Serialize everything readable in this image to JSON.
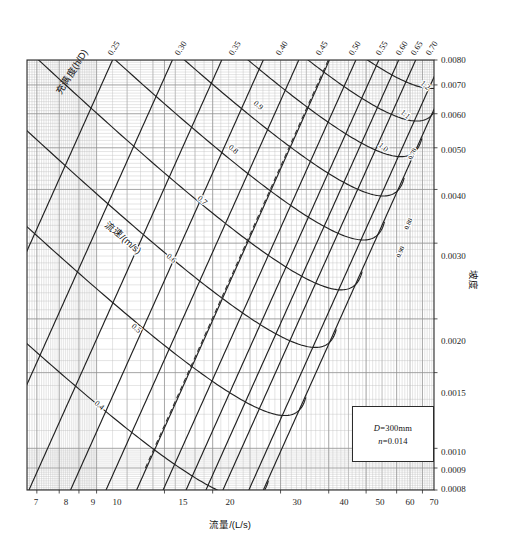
{
  "chart_data": {
    "type": "line",
    "title": "",
    "subtitle": "",
    "xlabel": "流量/(L/s)",
    "ylabel": "坡度",
    "toplabel": "充满度(h/D)",
    "inner_label": "流速/(m/s)",
    "xscale": "log",
    "yscale": "log",
    "xlim": [
      6.6,
      75
    ],
    "ylim": [
      0.0008,
      0.008
    ],
    "grid": true,
    "legend_position": "inner-bottom-right",
    "x_ticks": [
      7,
      8,
      9,
      10,
      15,
      20,
      30,
      40,
      50,
      60,
      70
    ],
    "x_tick_labels": [
      "7",
      "8",
      "9",
      "10",
      "15",
      "20",
      "30",
      "40",
      "50",
      "60",
      "70"
    ],
    "y_ticks": [
      0.0008,
      0.0009,
      0.001,
      0.0015,
      0.002,
      0.003,
      0.004,
      0.005,
      0.006,
      0.007,
      0.008
    ],
    "y_tick_labels": [
      "0.0008",
      "0.0009",
      "0.0010",
      "0.0015",
      "0.0020",
      "0.0030",
      "0.0040",
      "0.0050",
      "0.0060",
      "0.0070",
      "0.0080"
    ],
    "top_axis_label": "充满度(h/D)",
    "top_ticks": [
      0.25,
      0.3,
      0.35,
      0.4,
      0.45,
      0.5,
      0.55,
      0.6,
      0.65,
      0.7
    ],
    "top_tick_labels": [
      "0.25",
      "0.30",
      "0.35",
      "0.40",
      "0.45",
      "0.50",
      "0.55",
      "0.60",
      "0.65",
      "0.70"
    ],
    "series": [
      {
        "name": "fill-ratio-0.25",
        "kind": "fill-ratio",
        "value": 0.25,
        "label": "0.25"
      },
      {
        "name": "fill-ratio-0.30",
        "kind": "fill-ratio",
        "value": 0.3,
        "label": "0.30"
      },
      {
        "name": "fill-ratio-0.35",
        "kind": "fill-ratio",
        "value": 0.35,
        "label": "0.35"
      },
      {
        "name": "fill-ratio-0.40",
        "kind": "fill-ratio",
        "value": 0.4,
        "label": "0.40"
      },
      {
        "name": "fill-ratio-0.45",
        "kind": "fill-ratio",
        "value": 0.45,
        "label": "0.45"
      },
      {
        "name": "fill-ratio-0.50",
        "kind": "fill-ratio",
        "value": 0.5,
        "label": "0.50"
      },
      {
        "name": "fill-ratio-0.55",
        "kind": "fill-ratio",
        "value": 0.55,
        "label": "0.55"
      },
      {
        "name": "fill-ratio-0.60",
        "kind": "fill-ratio",
        "value": 0.6,
        "label": "0.60"
      },
      {
        "name": "fill-ratio-0.65",
        "kind": "fill-ratio",
        "value": 0.65,
        "label": "0.65"
      },
      {
        "name": "fill-ratio-0.70",
        "kind": "fill-ratio",
        "value": 0.7,
        "label": "0.70"
      },
      {
        "name": "fill-ratio-0.80",
        "kind": "fill-ratio-inner",
        "value": 0.8,
        "label": "0.80"
      },
      {
        "name": "fill-ratio-0.90",
        "kind": "fill-ratio-inner",
        "value": 0.9,
        "label": "0.90"
      },
      {
        "name": "velocity-0.4",
        "kind": "velocity",
        "value": 0.4,
        "label": "0.4"
      },
      {
        "name": "velocity-0.5",
        "kind": "velocity",
        "value": 0.5,
        "label": "0.5"
      },
      {
        "name": "velocity-0.6",
        "kind": "velocity",
        "value": 0.6,
        "label": "0.6"
      },
      {
        "name": "velocity-0.7",
        "kind": "velocity",
        "value": 0.7,
        "label": "0.7"
      },
      {
        "name": "velocity-0.8",
        "kind": "velocity",
        "value": 0.8,
        "label": "0.8"
      },
      {
        "name": "velocity-0.9",
        "kind": "velocity",
        "value": 0.9,
        "label": "0.9"
      },
      {
        "name": "velocity-1.0",
        "kind": "velocity",
        "value": 1.0,
        "label": "1.0"
      },
      {
        "name": "velocity-1.1",
        "kind": "velocity",
        "value": 1.1,
        "label": "1.1"
      },
      {
        "name": "velocity-1.2",
        "kind": "velocity",
        "value": 1.2,
        "label": "1.2"
      }
    ],
    "annotations": [
      {
        "name": "dashed-guide-line",
        "style": "dashed"
      }
    ]
  },
  "axes": {
    "x_title": "流量/(L/s)",
    "y_title": "坡度",
    "top_title": "充满度(h/D)",
    "inner_title": "流速/(m/s)"
  },
  "x_labels": {
    "t0": "7",
    "t1": "8",
    "t2": "9",
    "t3": "10",
    "t4": "15",
    "t5": "20",
    "t6": "30",
    "t7": "40",
    "t8": "50",
    "t9": "60",
    "t10": "70"
  },
  "y_labels": {
    "t0": "0.0080",
    "t1": "0.0070",
    "t2": "0.0060",
    "t3": "0.0050",
    "t4": "0.0040",
    "t5": "0.0030",
    "t6": "0.0020",
    "t7": "0.0015",
    "t8": "0.0010",
    "t9": "0.0009",
    "t10": "0.0008"
  },
  "top_labels": {
    "t0": "0.25",
    "t1": "0.30",
    "t2": "0.35",
    "t3": "0.40",
    "t4": "0.45",
    "t5": "0.50",
    "t6": "0.55",
    "t7": "0.60",
    "t8": "0.65",
    "t9": "0.70"
  },
  "velocity_labels": {
    "v04": "0.4",
    "v05": "0.5",
    "v06": "0.6",
    "v07": "0.7",
    "v08": "0.8",
    "v09": "0.9",
    "v10": "1.0",
    "v11": "1.1",
    "v12": "1.2"
  },
  "inner_fill_labels": {
    "f070": "0.70",
    "f080": "0.80",
    "f090": "0.90"
  },
  "legend": {
    "diameter": "D=300mm",
    "roughness": "n=0.014",
    "diameter_symbol": "D",
    "diameter_value": "=300mm",
    "roughness_symbol": "n",
    "roughness_value": "=0.014"
  },
  "colors": {
    "grid_minor": "#b9b9b9",
    "grid_major": "#8a8a8a",
    "curve": "#262626",
    "text": "#161616",
    "background": "#ffffff"
  }
}
